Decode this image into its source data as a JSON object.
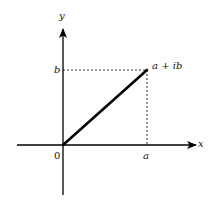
{
  "diagram": {
    "axes": {
      "x_label": "x",
      "y_label": "y",
      "origin_label": "0"
    },
    "point": {
      "label": "a + ib",
      "x_tick_label": "a",
      "y_tick_label": "b"
    },
    "colors": {
      "line": "#000000",
      "background": "#ffffff"
    }
  }
}
